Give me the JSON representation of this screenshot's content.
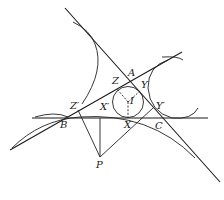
{
  "diagram": {
    "labels": {
      "A": "A",
      "B": "B",
      "C": "C",
      "X": "X",
      "Y": "Y",
      "Z": "Z",
      "I": "I",
      "P": "P",
      "Xp": "X′",
      "Yp": "Y′",
      "Zp": "Z′"
    },
    "colors": {
      "stroke": "#1a1a1a",
      "background": "#ffffff"
    }
  }
}
